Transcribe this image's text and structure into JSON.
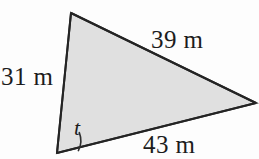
{
  "figure": {
    "kind": "geometry-diagram",
    "shape": "triangle",
    "width": 259,
    "height": 159,
    "background_color": "#fdfdfd",
    "fill_color": "#e0e0e0",
    "stroke_color": "#2a2a2a",
    "stroke_width": 2,
    "label_color": "#1c1c1c",
    "unit": "m",
    "vertices": {
      "top": {
        "x": 71,
        "y": 13
      },
      "right": {
        "x": 256,
        "y": 103
      },
      "bottom_left": {
        "x": 57,
        "y": 153
      }
    },
    "sides": [
      {
        "name": "left-side",
        "label": "31 m",
        "value": 31,
        "unit": "m",
        "from": "bottom_left",
        "to": "top"
      },
      {
        "name": "top-side",
        "label": "39 m",
        "value": 39,
        "unit": "m",
        "from": "top",
        "to": "right"
      },
      {
        "name": "base-side",
        "label": "43 m",
        "value": 43,
        "unit": "m",
        "from": "bottom_left",
        "to": "right"
      }
    ],
    "angles": [
      {
        "name": "angle-t",
        "label": "t",
        "at_vertex": "bottom_left",
        "marker": "single-arc",
        "arc_radius": 22
      }
    ]
  }
}
